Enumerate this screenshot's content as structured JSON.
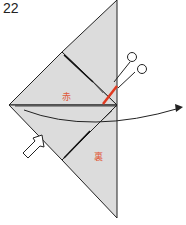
{
  "step_number": "22",
  "labels": {
    "upper_flap": "赤",
    "lower_flap": "裏"
  },
  "colors": {
    "paper": "#dcdcdc",
    "outline": "#222222",
    "cut_line": "#e03a20",
    "label": "#e05a3a"
  },
  "icons": [
    "scissors-icon",
    "push-arrow-icon",
    "curved-arrow-icon"
  ]
}
